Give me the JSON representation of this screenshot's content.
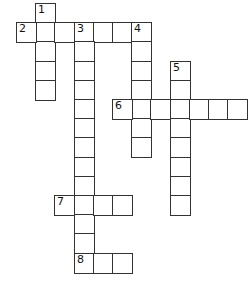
{
  "crossword": {
    "origin": {
      "x": 16,
      "y": 3
    },
    "cell_size": 19.2,
    "colors": {
      "border": "#333333",
      "background": "#ffffff",
      "number": "#111111"
    },
    "entries": [
      {
        "number": "1",
        "direction": "down",
        "row": 0,
        "col": 1,
        "length": 5
      },
      {
        "number": "2",
        "direction": "across",
        "row": 1,
        "col": 0,
        "length": 7
      },
      {
        "number": "3",
        "direction": "down",
        "row": 1,
        "col": 3,
        "length": 13
      },
      {
        "number": "4",
        "direction": "down",
        "row": 1,
        "col": 6,
        "length": 7
      },
      {
        "number": "5",
        "direction": "down",
        "row": 3,
        "col": 8,
        "length": 8
      },
      {
        "number": "6",
        "direction": "across",
        "row": 5,
        "col": 5,
        "length": 7
      },
      {
        "number": "7",
        "direction": "across",
        "row": 10,
        "col": 2,
        "length": 4
      },
      {
        "number": "8",
        "direction": "across",
        "row": 13,
        "col": 3,
        "length": 3
      }
    ]
  }
}
